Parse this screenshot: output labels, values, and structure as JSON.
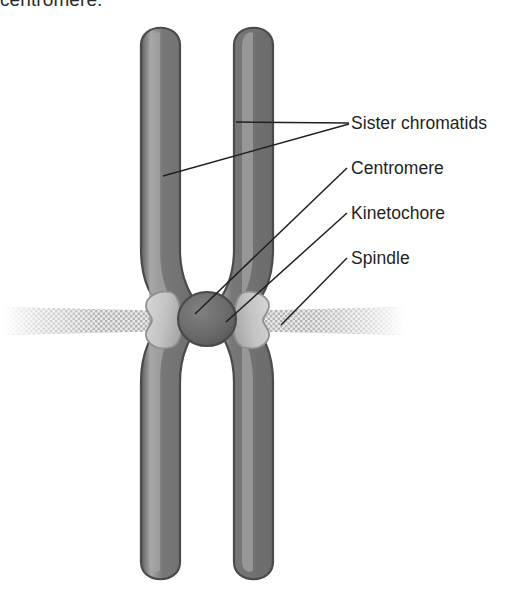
{
  "caption": {
    "fragment_text": "centromere."
  },
  "figure": {
    "labels": [
      {
        "id": "sister-chromatids",
        "text": "Sister chromatids"
      },
      {
        "id": "centromere",
        "text": "Centromere"
      },
      {
        "id": "kinetochore",
        "text": "Kinetochore"
      },
      {
        "id": "spindle",
        "text": "Spindle"
      }
    ],
    "colors": {
      "chromatid_body": "#6f6f6f",
      "chromatid_outline": "#4a4a4a",
      "chromatid_highlight": "#a9a9a9",
      "centromere_disc": "#6a6a6a",
      "centromere_disc_outline": "#4a4a4a",
      "kinetochore_lobe": "#c6c6c6",
      "kinetochore_lobe_outline": "#8e8e8e",
      "spindle_fiber": "#bdbdbd",
      "leader_line": "#231f20",
      "label_text": "#231f20",
      "background": "#ffffff"
    },
    "parts": [
      {
        "name": "sister-chromatid-left",
        "shape": "rounded-bar",
        "count": 1
      },
      {
        "name": "sister-chromatid-right",
        "shape": "rounded-bar",
        "count": 1
      },
      {
        "name": "centromere-disc",
        "shape": "disc",
        "count": 1
      },
      {
        "name": "kinetochore-lobe-left",
        "shape": "kidney",
        "count": 1
      },
      {
        "name": "kinetochore-lobe-right",
        "shape": "kidney",
        "count": 1
      },
      {
        "name": "spindle-fiber-left",
        "shape": "hatched-band",
        "count": 1
      },
      {
        "name": "spindle-fiber-right",
        "shape": "hatched-band",
        "count": 1
      }
    ]
  }
}
